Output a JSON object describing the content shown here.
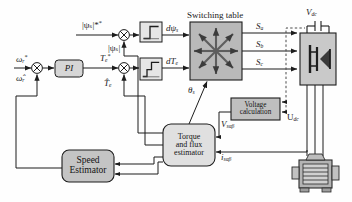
{
  "diagram": {
    "type": "control-block-diagram"
  },
  "blocks": {
    "pi": {
      "label": "PI",
      "x": 55,
      "y": 60,
      "w": 28,
      "h": 17
    },
    "switching_table": {
      "label": "Switching table",
      "x": 190,
      "y": 22,
      "w": 52,
      "h": 58
    },
    "hysteresis_flux": {
      "label": "",
      "x": 140,
      "y": 22,
      "w": 22,
      "h": 20,
      "kind": "two-level"
    },
    "hysteresis_torque": {
      "label": "",
      "x": 140,
      "y": 58,
      "w": 22,
      "h": 22,
      "kind": "three-level"
    },
    "voltage_calc": {
      "label": "Voltage calculation",
      "x": 231,
      "y": 98,
      "w": 49,
      "h": 22
    },
    "estimator": {
      "label": "Torque and flux estimator",
      "x": 163,
      "y": 124,
      "w": 52,
      "h": 42
    },
    "speed_estimator": {
      "label": "Speed Estimator",
      "x": 62,
      "y": 150,
      "w": 52,
      "h": 32
    },
    "inverter": {
      "label": "",
      "x": 300,
      "y": 33,
      "w": 36,
      "h": 52
    },
    "motor": {
      "label": "",
      "x": 291,
      "y": 155,
      "w": 48,
      "h": 38
    }
  },
  "labels": {
    "flux_ref": "|ψₛ|*",
    "flux_est": "|ψₛ|",
    "speed_ref": "ω",
    "speed_ref_sub": "r",
    "speed_ref_sup": "*",
    "speed_est": "ω̂",
    "speed_est_sub": "r",
    "torque_ref": "T",
    "torque_ref_sub": "e",
    "torque_ref_sup": "*",
    "torque_est": "T̂",
    "torque_est_sub": "e",
    "d_flux": "dψ",
    "d_flux_sub": "s",
    "d_torque": "dT",
    "d_torque_sub": "e",
    "theta_s": "θ",
    "theta_s_sub": "s",
    "switch_a": "S",
    "switch_a_sub": "a",
    "switch_b": "S",
    "switch_b_sub": "b",
    "switch_c": "S",
    "switch_c_sub": "c",
    "vdc": "V",
    "vdc_sub": "dc",
    "udc": "U",
    "udc_sub": "dc",
    "v_sab": "V",
    "v_sab_sub": "sαβ",
    "i_sab": "i",
    "i_sab_sub": "sαβ",
    "switching_table_title": "Switching table",
    "voltage_calc_line1": "Voltage",
    "voltage_calc_line2": "calculation",
    "estimator_line1": "Torque",
    "estimator_line2": "and flux",
    "estimator_line3": "estimator",
    "speed_est_line1": "Speed",
    "speed_est_line2": "Estimator",
    "pi_label": "PI"
  },
  "colors": {
    "line": "#1d1d1d",
    "block_fill": "#d4d4d4",
    "block_fill_light": "#e2e2e2",
    "switch_fill": "#b9b9b9",
    "inverter_fill": "#c9c9c9",
    "motor_fill": "#b0b0b0",
    "text": "#111111",
    "background": "#ffffff"
  }
}
